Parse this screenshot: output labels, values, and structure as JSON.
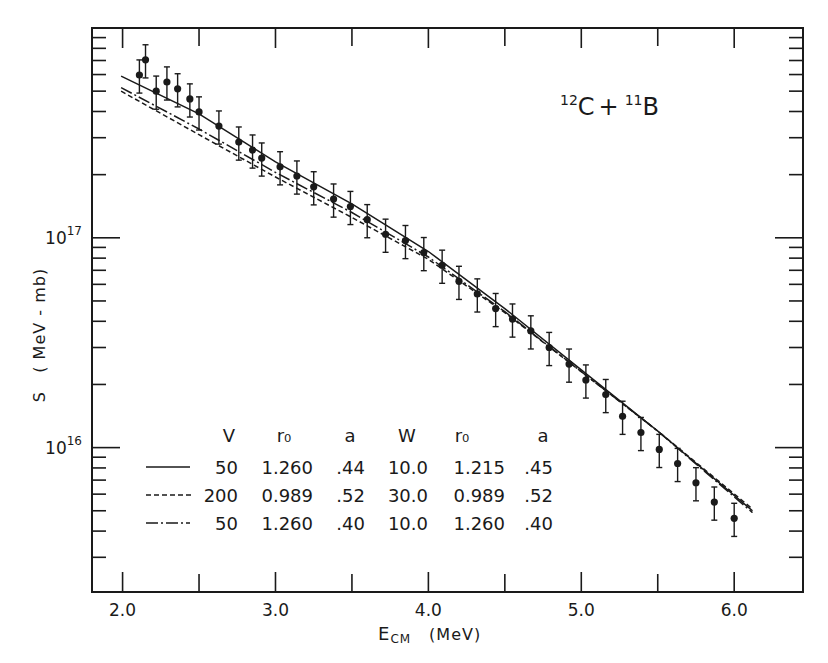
{
  "chart_data": {
    "type": "scatter",
    "title": "",
    "annotation": {
      "mass1": "12",
      "elem1": "C",
      "plus": "+",
      "mass2": "11",
      "elem2": "B"
    },
    "xlabel": {
      "main": "E",
      "sub": "CM",
      "unit": "(MeV)"
    },
    "ylabel": "S   ( MeV - mb)",
    "xlim": [
      1.8,
      6.45
    ],
    "ylim": [
      2050000000000000.0,
      1e+18
    ],
    "yscale": "log",
    "x_ticks": [
      2.0,
      2.5,
      3.0,
      3.5,
      4.0,
      4.5,
      5.0,
      5.5,
      6.0
    ],
    "x_tick_labels": [
      {
        "value": 2.0,
        "label": "2.0"
      },
      {
        "value": 3.0,
        "label": "3.0"
      },
      {
        "value": 4.0,
        "label": "4.0"
      },
      {
        "value": 5.0,
        "label": "5.0"
      },
      {
        "value": 6.0,
        "label": "6.0"
      }
    ],
    "y_tick_labels": [
      {
        "value": 1e+17,
        "base": "10",
        "exp": "17"
      },
      {
        "value": 1e+16,
        "base": "10",
        "exp": "16"
      }
    ],
    "grid": false,
    "series": [
      {
        "name": "Experimental data",
        "kind": "points-with-errorbars",
        "relative_error": 0.18,
        "points": [
          [
            2.11,
            5.97e+17
          ],
          [
            2.15,
            7.05e+17
          ],
          [
            2.22,
            5e+17
          ],
          [
            2.29,
            5.53e+17
          ],
          [
            2.36,
            5.13e+17
          ],
          [
            2.44,
            4.59e+17
          ],
          [
            2.5,
            3.98e+17
          ],
          [
            2.63,
            3.41e+17
          ],
          [
            2.76,
            2.86e+17
          ],
          [
            2.85,
            2.62e+17
          ],
          [
            2.91,
            2.4e+17
          ],
          [
            3.03,
            2.18e+17
          ],
          [
            3.14,
            1.97e+17
          ],
          [
            3.25,
            1.75e+17
          ],
          [
            3.38,
            1.53e+17
          ],
          [
            3.49,
            1.41e+17
          ],
          [
            3.6,
            1.22e+17
          ],
          [
            3.72,
            1.04e+17
          ],
          [
            3.85,
            9.7e+16
          ],
          [
            3.97,
            8.5e+16
          ],
          [
            4.09,
            7.4e+16
          ],
          [
            4.2,
            6.2e+16
          ],
          [
            4.32,
            5.4e+16
          ],
          [
            4.44,
            4.6e+16
          ],
          [
            4.55,
            4.1e+16
          ],
          [
            4.67,
            3.6e+16
          ],
          [
            4.79,
            3e+16
          ],
          [
            4.92,
            2.5e+16
          ],
          [
            5.03,
            2.1e+16
          ],
          [
            5.16,
            1.79e+16
          ],
          [
            5.27,
            1.41e+16
          ],
          [
            5.39,
            1.18e+16
          ],
          [
            5.51,
            9800000000000000.0
          ],
          [
            5.63,
            8400000000000000.0
          ],
          [
            5.75,
            6800000000000000.0
          ],
          [
            5.87,
            5500000000000000.0
          ],
          [
            6.0,
            4600000000000000.0
          ]
        ]
      },
      {
        "name": "V=50 r0=1.260 a=.44 W=10.0 r0=1.215 a=.45",
        "kind": "line",
        "style": "solid",
        "points": [
          [
            1.99,
            5.9e+17
          ],
          [
            2.5,
            3.9e+17
          ],
          [
            3.0,
            2.3e+17
          ],
          [
            3.5,
            1.45e+17
          ],
          [
            4.0,
            8.6e+16
          ],
          [
            4.5,
            4.6e+16
          ],
          [
            5.0,
            2.35e+16
          ],
          [
            5.5,
            1.2e+16
          ],
          [
            6.12,
            5000000000000000.0
          ]
        ]
      },
      {
        "name": "V=200 r0=0.989 a=.52 W=30.0 r0=0.989 a=.52",
        "kind": "line",
        "style": "dashed",
        "points": [
          [
            1.99,
            5e+17
          ],
          [
            2.5,
            3.1e+17
          ],
          [
            3.0,
            1.95e+17
          ],
          [
            3.5,
            1.25e+17
          ],
          [
            4.0,
            7.9e+16
          ],
          [
            4.5,
            4.4e+16
          ],
          [
            5.0,
            2.3e+16
          ],
          [
            5.5,
            1.2e+16
          ],
          [
            6.12,
            5100000000000000.0
          ]
        ]
      },
      {
        "name": "V=50 r0=1.260 a=.40 W=10.0 r0=1.260 a=.40",
        "kind": "line",
        "style": "dashdot",
        "points": [
          [
            1.99,
            5.2e+17
          ],
          [
            2.5,
            3.3e+17
          ],
          [
            3.0,
            2.05e+17
          ],
          [
            3.5,
            1.32e+17
          ],
          [
            4.0,
            8.1e+16
          ],
          [
            4.5,
            4.45e+16
          ],
          [
            5.0,
            2.3e+16
          ],
          [
            5.5,
            1.2e+16
          ],
          [
            6.12,
            4900000000000000.0
          ]
        ]
      }
    ],
    "legend": {
      "placement": "bottom-left",
      "headers": [
        "V",
        "r₀",
        "a",
        "W",
        "r₀",
        "a"
      ],
      "rows": [
        {
          "style": "solid",
          "values": [
            "50",
            "1.260",
            ".44",
            "10.0",
            "1.215",
            ".45"
          ]
        },
        {
          "style": "dashed",
          "values": [
            "200",
            "0.989",
            ".52",
            "30.0",
            "0.989",
            ".52"
          ]
        },
        {
          "style": "dashdot",
          "values": [
            "50",
            "1.260",
            ".40",
            "10.0",
            "1.260",
            ".40"
          ]
        }
      ]
    }
  }
}
